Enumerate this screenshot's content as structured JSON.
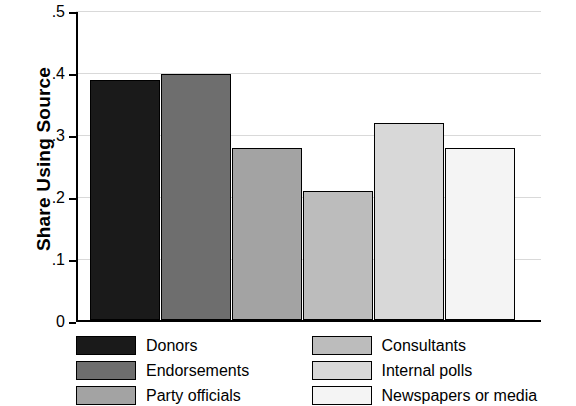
{
  "chart_data": {
    "type": "bar",
    "title": "",
    "xlabel": "",
    "ylabel": "Share Using Source",
    "ylim": [
      0,
      0.5
    ],
    "ytick_labels": [
      "0",
      ".1",
      ".2",
      ".3",
      ".4",
      ".5"
    ],
    "ytick_values": [
      0,
      0.1,
      0.2,
      0.3,
      0.4,
      0.5
    ],
    "grid": true,
    "legend_position": "bottom",
    "categories": [
      "Donors",
      "Endorsements",
      "Party officials",
      "Consultants",
      "Internal polls",
      "Newspapers or media"
    ],
    "values": [
      0.39,
      0.4,
      0.28,
      0.21,
      0.32,
      0.28
    ],
    "colors": [
      "#1a1a1a",
      "#6e6e6e",
      "#a3a3a3",
      "#bcbcbc",
      "#d8d8d8",
      "#f4f4f4"
    ],
    "bar_outline_color": "#000000"
  },
  "legend": {
    "entries": [
      {
        "label": "Donors",
        "color": "#1a1a1a"
      },
      {
        "label": "Consultants",
        "color": "#bcbcbc"
      },
      {
        "label": "Endorsements",
        "color": "#6e6e6e"
      },
      {
        "label": "Internal polls",
        "color": "#d8d8d8"
      },
      {
        "label": "Party officials",
        "color": "#a3a3a3"
      },
      {
        "label": "Newspapers or media",
        "color": "#f4f4f4"
      }
    ]
  }
}
